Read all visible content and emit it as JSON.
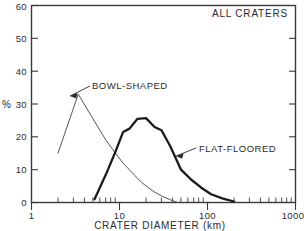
{
  "chart_data": {
    "type": "line",
    "title": "ALL CRATERS",
    "xlabel": "CRATER DIAMETER (km)",
    "ylabel": "%",
    "xscale": "log",
    "yscale": "linear",
    "xlim": [
      1,
      1000
    ],
    "ylim": [
      0,
      60
    ],
    "grid": false,
    "legend_position": "inline-annotations",
    "x_tick_labels": [
      "1",
      "10",
      "100",
      "1000"
    ],
    "x_tick_values": [
      1,
      10,
      100,
      1000
    ],
    "y_tick_labels": [
      "0",
      "10",
      "20",
      "30",
      "40",
      "50",
      "60"
    ],
    "y_tick_values": [
      0,
      10,
      20,
      30,
      40,
      50,
      60
    ],
    "series": [
      {
        "name": "BOWL-SHAPED",
        "style": "thin",
        "x": [
          2.0,
          3.4,
          5.0,
          7.0,
          9.0,
          11.0,
          14.0,
          18.0,
          24.0,
          30.0,
          38.0,
          46.0
        ],
        "y": [
          15.0,
          33.0,
          25.5,
          19.0,
          15.0,
          12.0,
          9.0,
          6.0,
          3.5,
          2.0,
          0.8,
          0.0
        ]
      },
      {
        "name": "FLAT-FLOORED",
        "style": "thick",
        "x": [
          5.2,
          7.0,
          9.0,
          11.0,
          13.0,
          16.0,
          20.0,
          25.0,
          30.0,
          38.0,
          50.0,
          65.0,
          85.0,
          110.0,
          150.0,
          200.0
        ],
        "y": [
          1.0,
          8.5,
          15.5,
          21.5,
          22.5,
          25.5,
          25.7,
          23.0,
          22.0,
          17.0,
          10.0,
          7.0,
          4.5,
          2.5,
          1.2,
          0.3
        ]
      }
    ],
    "annotations": [
      {
        "text": "BOWL-SHAPED",
        "points_to_series": "BOWL-SHAPED"
      },
      {
        "text": "FLAT-FLOORED",
        "points_to_series": "FLAT-FLOORED"
      }
    ]
  }
}
